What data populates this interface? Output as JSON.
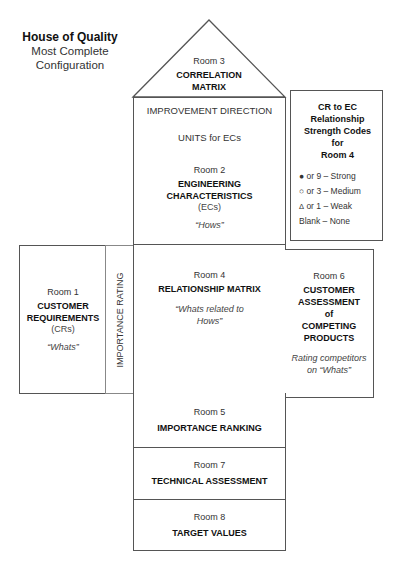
{
  "title": {
    "main": "House of Quality",
    "line2": "Most Complete",
    "line3": "Configuration"
  },
  "room3": {
    "room": "Room 3",
    "name_line1": "CORRELATION",
    "name_line2": "MATRIX"
  },
  "improvement_direction": "IMPROVEMENT DIRECTION",
  "units": "UNITS for ECs",
  "room2": {
    "room": "Room 2",
    "name_line1": "ENGINEERING",
    "name_line2": "CHARACTERISTICS",
    "abbr": "(ECs)",
    "tag": "“Hows”"
  },
  "legend": {
    "title_lines": [
      "CR to EC",
      "Relationship",
      "Strength Codes for",
      "Room 4"
    ],
    "items": [
      {
        "symbol": "●",
        "text": "or 9 – Strong"
      },
      {
        "symbol": "○",
        "text": "or 3 – Medium"
      },
      {
        "symbol": "Δ",
        "text": "or 1 – Weak"
      },
      {
        "symbol": "",
        "text": "Blank – None"
      }
    ]
  },
  "room1": {
    "room": "Room 1",
    "name_line1": "CUSTOMER",
    "name_line2": "REQUIREMENTS",
    "abbr": "(CRs)",
    "tag": "“Whats”"
  },
  "importance_rating": "IMPORTANCE RATING",
  "room4": {
    "room": "Room 4",
    "name": "RELATIONSHIP MATRIX",
    "tag_line1": "“Whats related to",
    "tag_line2": "Hows”"
  },
  "room6": {
    "room": "Room 6",
    "name_lines": [
      "CUSTOMER",
      "ASSESSMENT",
      "of",
      "COMPETING",
      "PRODUCTS"
    ],
    "tag_line1": "Rating competitors",
    "tag_line2": "on “Whats”"
  },
  "room5": {
    "room": "Room 5",
    "name": "IMPORTANCE RANKING"
  },
  "room7": {
    "room": "Room 7",
    "name": "TECHNICAL ASSESSMENT"
  },
  "room8": {
    "room": "Room 8",
    "name": "TARGET VALUES"
  }
}
